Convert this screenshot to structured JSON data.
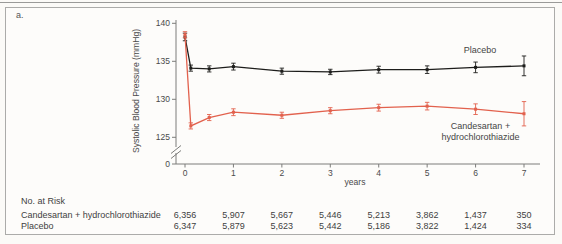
{
  "figure": {
    "panel_label": "a."
  },
  "chart_data": {
    "type": "line",
    "title": "",
    "xlabel": "years",
    "ylabel": "Systolic Blood Pressure (mmHg)",
    "x": [
      0,
      0.12,
      0.5,
      1,
      2,
      3,
      4,
      5,
      6,
      7
    ],
    "xticks": [
      "0",
      "1",
      "2",
      "3",
      "4",
      "5",
      "6",
      "7"
    ],
    "yticks": [
      "140",
      "135",
      "130",
      "125"
    ],
    "y_zero_label": "0",
    "y_axis_break": true,
    "ylim": [
      125,
      140
    ],
    "legend_position": "inline-labels",
    "grid": false,
    "series": [
      {
        "name": "Placebo",
        "color": "#1d1d1b",
        "marker": "square",
        "values": [
          138.2,
          134.1,
          134.0,
          134.3,
          133.7,
          133.6,
          133.9,
          133.9,
          134.2,
          134.4
        ],
        "err": [
          0.5,
          0.4,
          0.4,
          0.45,
          0.4,
          0.35,
          0.45,
          0.5,
          0.7,
          1.3
        ],
        "label_lines": [
          "Placebo"
        ]
      },
      {
        "name": "Candesartan + hydrochlorothiazide",
        "color": "#e2614d",
        "marker": "square",
        "values": [
          138.5,
          126.5,
          127.6,
          128.3,
          127.9,
          128.5,
          128.9,
          129.1,
          128.7,
          128.1
        ],
        "err": [
          0.4,
          0.4,
          0.4,
          0.45,
          0.4,
          0.4,
          0.45,
          0.5,
          0.7,
          1.6
        ],
        "label_lines": [
          "Candesartan +",
          "hydrochlorothiazide"
        ]
      }
    ]
  },
  "risk_table": {
    "title": "No. at Risk",
    "rows": [
      {
        "label": "Candesartan + hydrochlorothiazide",
        "counts": [
          "6,356",
          "5,907",
          "5,667",
          "5,446",
          "5,213",
          "3,862",
          "1,437",
          "350"
        ]
      },
      {
        "label": "Placebo",
        "counts": [
          "6,347",
          "5,879",
          "5,623",
          "5,442",
          "5,186",
          "3,822",
          "1,424",
          "334"
        ]
      }
    ]
  }
}
